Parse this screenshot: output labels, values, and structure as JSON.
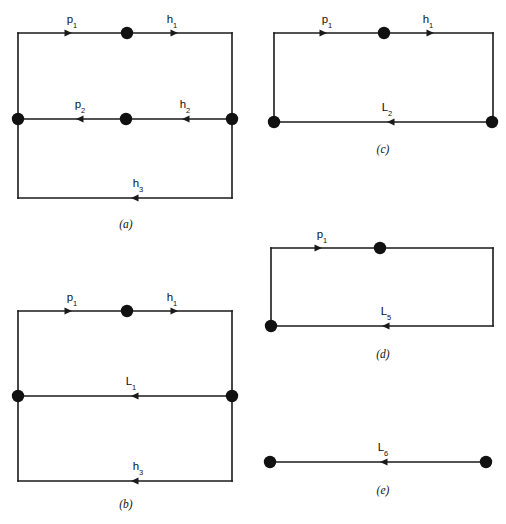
{
  "figure": {
    "width": 506,
    "height": 524,
    "background": "#ffffff",
    "ink_color": "#1a1a1a",
    "node_color": "#111111",
    "panels": [
      {
        "id": "a",
        "caption": "(a)",
        "caption_x": 126,
        "caption_y": 228,
        "shape": "rectangle-with-middle-edge",
        "box": {
          "x": 18,
          "y": 33,
          "width": 214,
          "height": 165
        },
        "middle_y": 119,
        "edges": [
          {
            "name": "top",
            "label": "p",
            "sub": "1",
            "label_x": 72,
            "label_y": 23,
            "direction": "right",
            "arrow_x": 72,
            "arrow_y": 33
          },
          {
            "name": "top-right",
            "label": "h",
            "sub": "1",
            "label_x": 172,
            "label_y": 23,
            "direction": "right",
            "arrow_x": 178,
            "arrow_y": 33
          },
          {
            "name": "middle-left",
            "label": "p",
            "sub": "2",
            "label_x": 80,
            "label_y": 108,
            "direction": "left",
            "arrow_x": 76,
            "arrow_y": 119
          },
          {
            "name": "middle-right",
            "label": "h",
            "sub": "2",
            "label_x": 185,
            "label_y": 108,
            "direction": "left",
            "arrow_x": 182,
            "arrow_y": 119
          },
          {
            "name": "bottom",
            "label": "h",
            "sub": "3",
            "label_x": 138,
            "label_y": 187,
            "direction": "left",
            "arrow_x": 131,
            "arrow_y": 198
          }
        ],
        "nodes": [
          {
            "name": "top-center",
            "x": 127,
            "y": 33,
            "r": 6.2
          },
          {
            "name": "middle-left-corner",
            "x": 18,
            "y": 119,
            "r": 6.2
          },
          {
            "name": "middle-center",
            "x": 126,
            "y": 119,
            "r": 6.2
          },
          {
            "name": "middle-right-corner",
            "x": 232,
            "y": 119,
            "r": 6.2
          }
        ]
      },
      {
        "id": "b",
        "caption": "(b)",
        "caption_x": 126,
        "caption_y": 508,
        "shape": "rectangle-with-middle-edge",
        "box": {
          "x": 18,
          "y": 311,
          "width": 214,
          "height": 170
        },
        "middle_y": 396,
        "edges": [
          {
            "name": "top",
            "label": "p",
            "sub": "1",
            "label_x": 72,
            "label_y": 301,
            "direction": "right",
            "arrow_x": 72,
            "arrow_y": 311
          },
          {
            "name": "top-right",
            "label": "h",
            "sub": "1",
            "label_x": 172,
            "label_y": 301,
            "direction": "right",
            "arrow_x": 178,
            "arrow_y": 311
          },
          {
            "name": "middle",
            "label": "L",
            "sub": "1",
            "label_x": 131,
            "label_y": 385,
            "direction": "left",
            "arrow_x": 131,
            "arrow_y": 396
          },
          {
            "name": "bottom",
            "label": "h",
            "sub": "3",
            "label_x": 138,
            "label_y": 470,
            "direction": "left",
            "arrow_x": 131,
            "arrow_y": 481
          }
        ],
        "nodes": [
          {
            "name": "top-center",
            "x": 127,
            "y": 311,
            "r": 6.2
          },
          {
            "name": "middle-left-corner",
            "x": 18,
            "y": 396,
            "r": 6.2
          },
          {
            "name": "middle-right-corner",
            "x": 232,
            "y": 396,
            "r": 6.2
          }
        ]
      },
      {
        "id": "c",
        "caption": "(c)",
        "caption_x": 383,
        "caption_y": 153,
        "shape": "rectangle",
        "box": {
          "x": 274,
          "y": 33,
          "width": 219,
          "height": 89
        },
        "edges": [
          {
            "name": "top",
            "label": "p",
            "sub": "1",
            "label_x": 327,
            "label_y": 23,
            "direction": "right",
            "arrow_x": 327,
            "arrow_y": 33
          },
          {
            "name": "top-right",
            "label": "h",
            "sub": "1",
            "label_x": 428,
            "label_y": 23,
            "direction": "right",
            "arrow_x": 434,
            "arrow_y": 33
          },
          {
            "name": "bottom",
            "label": "L",
            "sub": "2",
            "label_x": 387,
            "label_y": 111,
            "direction": "left",
            "arrow_x": 387,
            "arrow_y": 122
          }
        ],
        "nodes": [
          {
            "name": "top-center",
            "x": 384,
            "y": 33,
            "r": 6.2
          },
          {
            "name": "bottom-left-corner",
            "x": 274,
            "y": 122,
            "r": 6.2
          },
          {
            "name": "bottom-right-corner",
            "x": 492,
            "y": 122,
            "r": 6.2
          }
        ]
      },
      {
        "id": "d",
        "caption": "(d)",
        "caption_x": 383,
        "caption_y": 358,
        "shape": "rectangle",
        "box": {
          "x": 271,
          "y": 248,
          "width": 222,
          "height": 78
        },
        "edges": [
          {
            "name": "top",
            "label": "p",
            "sub": "1",
            "label_x": 322,
            "label_y": 238,
            "direction": "right",
            "arrow_x": 322,
            "arrow_y": 248
          },
          {
            "name": "bottom",
            "label": "L",
            "sub": "5",
            "label_x": 386,
            "label_y": 315,
            "direction": "left",
            "arrow_x": 382,
            "arrow_y": 326
          }
        ],
        "nodes": [
          {
            "name": "top-center",
            "x": 380,
            "y": 248,
            "r": 6.2
          },
          {
            "name": "bottom-left-corner",
            "x": 271,
            "y": 326,
            "r": 6.2
          }
        ]
      },
      {
        "id": "e",
        "caption": "(e)",
        "caption_x": 383,
        "caption_y": 494,
        "shape": "single-segment",
        "segment": {
          "x1": 270,
          "y1": 462,
          "x2": 486,
          "y2": 462
        },
        "edges": [
          {
            "name": "segment",
            "label": "L",
            "sub": "6",
            "label_x": 383,
            "label_y": 451,
            "direction": "left",
            "arrow_x": 380,
            "arrow_y": 462
          }
        ],
        "nodes": [
          {
            "name": "left-endpoint",
            "x": 270,
            "y": 462,
            "r": 6.2
          },
          {
            "name": "right-endpoint",
            "x": 486,
            "y": 462,
            "r": 6.2
          }
        ]
      }
    ]
  }
}
